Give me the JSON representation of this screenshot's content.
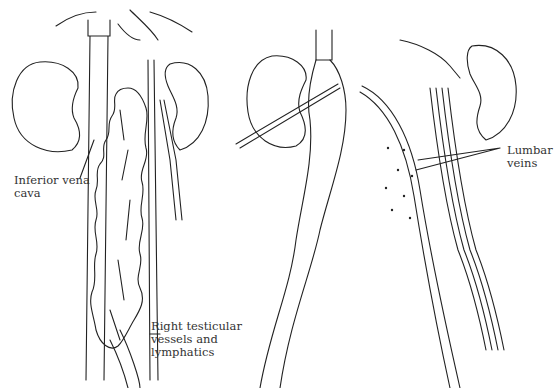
{
  "figure": {
    "left_panel": {
      "labels": [
        {
          "id": "ivc",
          "text": "Inferior vena\ncava"
        },
        {
          "id": "rtv",
          "text": "Right testicular\nvessels and\nlymphatics"
        }
      ]
    },
    "right_panel": {
      "labels": [
        {
          "id": "lumbar",
          "text": "Lumbar\nveins"
        }
      ]
    },
    "line_color": "#222222"
  }
}
